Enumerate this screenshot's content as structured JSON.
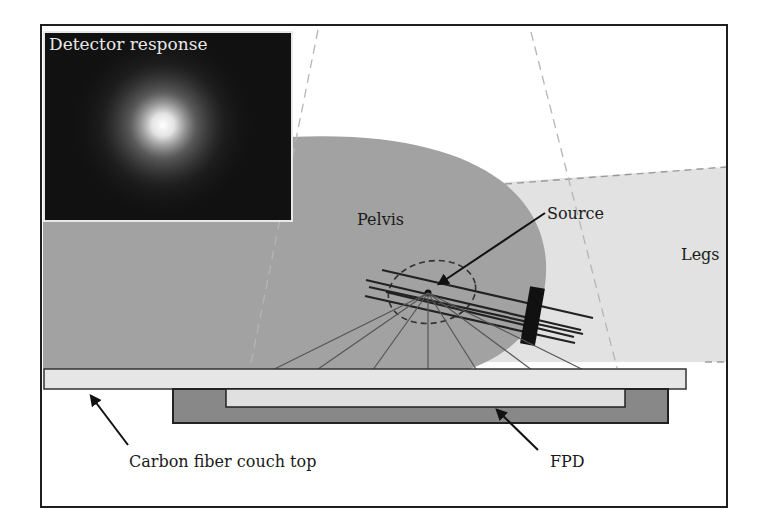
{
  "figure": {
    "inset": {
      "title": "Detector response"
    },
    "labels": {
      "pelvis": "Pelvis",
      "source": "Source",
      "legs": "Legs",
      "couch_top": "Carbon fiber couch top",
      "fpd": "FPD"
    },
    "colors": {
      "frame": "#1e1e1e",
      "pelvis_fill": "#a2a2a2",
      "legs_fill": "#e2e2e2",
      "couch_fill": "#e6e6e6",
      "fpd_outer_fill": "#888888",
      "fpd_inner_fill": "#e0e0e0",
      "inset_bg": "#111111",
      "applicator": "#111111"
    }
  }
}
